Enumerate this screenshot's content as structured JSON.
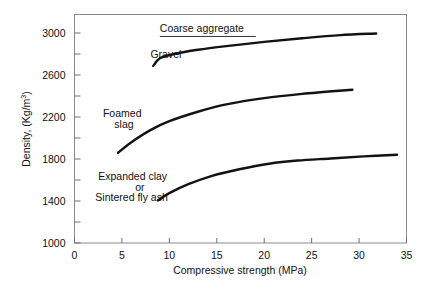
{
  "chart_data": {
    "type": "line",
    "title": "",
    "xlabel": "Compressive strength (MPa)",
    "ylabel": "Density, (Kg/m3)",
    "ylabel_base": "Density, (Kg/m",
    "ylabel_exp": "3",
    "ylabel_tail": ")",
    "xlim": [
      0,
      35
    ],
    "ylim": [
      1000,
      3100
    ],
    "grid": false,
    "legend_position": "inline-annotations",
    "x_ticks_major": [
      0,
      5,
      10,
      15,
      20,
      25,
      30,
      35
    ],
    "x_tick_labels": [
      "0",
      "5",
      "10",
      "15",
      "20",
      "25",
      "30",
      "35"
    ],
    "y_ticks_major": [
      1000,
      1400,
      1800,
      2200,
      2600,
      3000
    ],
    "y_tick_labels": [
      "1000",
      "1400",
      "1800",
      "2200",
      "2600",
      "3000"
    ],
    "y_ticks_minor": [
      1200,
      1600,
      2000,
      2400,
      2800
    ],
    "series": [
      {
        "name": "Gravel",
        "label": "Gravel",
        "annotation_group": "Coarse aggregate",
        "points": [
          [
            8.3,
            2685
          ],
          [
            9.0,
            2760
          ],
          [
            10.5,
            2800
          ],
          [
            13.0,
            2840
          ],
          [
            16.0,
            2875
          ],
          [
            20.0,
            2915
          ],
          [
            24.0,
            2950
          ],
          [
            28.0,
            2980
          ],
          [
            31.8,
            2995
          ]
        ]
      },
      {
        "name": "Foamed slag",
        "label": "Foamed slag",
        "points": [
          [
            4.6,
            1860
          ],
          [
            6.0,
            1960
          ],
          [
            8.0,
            2075
          ],
          [
            10.0,
            2160
          ],
          [
            13.0,
            2250
          ],
          [
            16.0,
            2320
          ],
          [
            20.0,
            2380
          ],
          [
            24.0,
            2420
          ],
          [
            29.3,
            2460
          ]
        ]
      },
      {
        "name": "Expanded clay or Sintered fly ash",
        "label": "Expanded clay or Sintered fly ash",
        "points": [
          [
            8.8,
            1405
          ],
          [
            10.0,
            1475
          ],
          [
            12.0,
            1560
          ],
          [
            14.5,
            1640
          ],
          [
            17.5,
            1705
          ],
          [
            20.5,
            1755
          ],
          [
            23.5,
            1785
          ],
          [
            27.0,
            1805
          ],
          [
            30.5,
            1825
          ],
          [
            34.0,
            1840
          ]
        ]
      }
    ],
    "annotations": [
      {
        "id": "coarse-aggregate",
        "text": "Coarse aggregate",
        "x": 9.0,
        "y": 3010,
        "underline": true
      },
      {
        "id": "gravel",
        "text": "Gravel",
        "x": 8.0,
        "y": 2760,
        "underline": false
      },
      {
        "id": "foamed",
        "text": "Foamed",
        "x": 3.0,
        "y": 2200,
        "underline": false
      },
      {
        "id": "slag",
        "text": "slag",
        "x": 4.2,
        "y": 2095,
        "underline": false
      },
      {
        "id": "expanded-clay",
        "text": "Expanded clay",
        "x": 2.5,
        "y": 1600,
        "underline": false
      },
      {
        "id": "or",
        "text": "or",
        "x": 6.4,
        "y": 1500,
        "underline": false
      },
      {
        "id": "sintered-fly-ash",
        "text": "Sintered fly ash",
        "x": 2.2,
        "y": 1400,
        "underline": false
      }
    ],
    "colors": {
      "curve": "#121212",
      "frame": "#8a8a8a",
      "text": "#111111",
      "background": "#ffffff"
    }
  }
}
